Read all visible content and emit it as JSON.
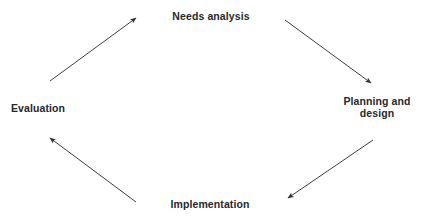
{
  "diagram": {
    "type": "cycle",
    "title": "",
    "direction": "clockwise",
    "background_color": "#ffffff",
    "text_color": "#26282b",
    "arrow_color": "#3a3d42",
    "nodes": [
      {
        "id": "needs-analysis",
        "label": "Needs analysis",
        "position": "top-center"
      },
      {
        "id": "planning-design",
        "label": "Planning and\ndesign",
        "position": "right"
      },
      {
        "id": "implementation",
        "label": "Implementation",
        "position": "bottom-center"
      },
      {
        "id": "evaluation",
        "label": "Evaluation",
        "position": "left"
      }
    ],
    "arrows": [
      {
        "id": "arrow-evaluation-to-needs-analysis",
        "from": "evaluation",
        "to": "needs-analysis",
        "x1": 50,
        "y1": 81,
        "x2": 136,
        "y2": 18
      },
      {
        "id": "arrow-needs-analysis-to-planning-design",
        "from": "needs-analysis",
        "to": "planning-design",
        "x1": 285,
        "y1": 20,
        "x2": 371,
        "y2": 83
      },
      {
        "id": "arrow-planning-design-to-implementation",
        "from": "planning-design",
        "to": "implementation",
        "x1": 373,
        "y1": 140,
        "x2": 288,
        "y2": 198
      },
      {
        "id": "arrow-implementation-to-evaluation",
        "from": "implementation",
        "to": "evaluation",
        "x1": 136,
        "y1": 202,
        "x2": 50,
        "y2": 138
      }
    ]
  }
}
